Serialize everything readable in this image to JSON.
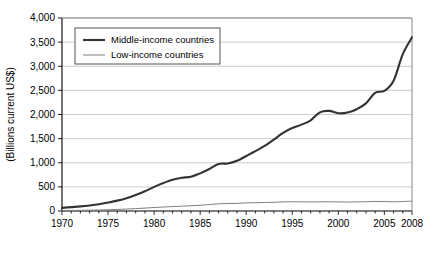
{
  "chart_data": {
    "type": "line",
    "title": "",
    "xlabel": "",
    "ylabel": "(Billions current US$)",
    "xlim": [
      1970,
      2008
    ],
    "ylim": [
      0,
      4000
    ],
    "grid": true,
    "legend_position": "top-left",
    "x_tick_labels": [
      "1970",
      "1975",
      "1980",
      "1985",
      "1990",
      "1995",
      "2000",
      "2005",
      "2008"
    ],
    "x_tick_values": [
      1970,
      1975,
      1980,
      1985,
      1990,
      1995,
      2000,
      2005,
      2008
    ],
    "x_minor_ticks": [
      1970,
      1971,
      1972,
      1973,
      1974,
      1975,
      1976,
      1977,
      1978,
      1979,
      1980,
      1981,
      1982,
      1983,
      1984,
      1985,
      1986,
      1987,
      1988,
      1989,
      1990,
      1991,
      1992,
      1993,
      1994,
      1995,
      1996,
      1997,
      1998,
      1999,
      2000,
      2001,
      2002,
      2003,
      2004,
      2005,
      2006,
      2007,
      2008
    ],
    "y_tick_labels": [
      "0",
      "500",
      "1,000",
      "1,500",
      "2,000",
      "2,500",
      "3,000",
      "3,500",
      "4,000"
    ],
    "y_tick_values": [
      0,
      500,
      1000,
      1500,
      2000,
      2500,
      3000,
      3500,
      4000
    ],
    "x": [
      1970,
      1971,
      1972,
      1973,
      1974,
      1975,
      1976,
      1977,
      1978,
      1979,
      1980,
      1981,
      1982,
      1983,
      1984,
      1985,
      1986,
      1987,
      1988,
      1989,
      1990,
      1991,
      1992,
      1993,
      1994,
      1995,
      1996,
      1997,
      1998,
      1999,
      2000,
      2001,
      2002,
      2003,
      2004,
      2005,
      2006,
      2007,
      2008
    ],
    "series": [
      {
        "name": "Middle-income countries",
        "color": "#333333",
        "width": 2.1,
        "values": [
          65,
          80,
          95,
          115,
          140,
          175,
          215,
          265,
          330,
          410,
          500,
          580,
          650,
          690,
          710,
          780,
          870,
          975,
          985,
          1040,
          1140,
          1240,
          1350,
          1480,
          1620,
          1720,
          1790,
          1880,
          2045,
          2075,
          2025,
          2040,
          2110,
          2230,
          2450,
          2490,
          2700,
          3250,
          3600
        ]
      },
      {
        "name": "Low-income countries",
        "color": "#808080",
        "width": 1.0,
        "values": [
          10,
          12,
          14,
          17,
          21,
          26,
          32,
          40,
          50,
          60,
          72,
          82,
          92,
          100,
          108,
          120,
          133,
          150,
          155,
          158,
          168,
          172,
          176,
          180,
          188,
          192,
          190,
          188,
          190,
          192,
          188,
          186,
          188,
          192,
          198,
          196,
          190,
          196,
          205
        ]
      }
    ]
  },
  "legend": {
    "items": [
      {
        "label": "Middle-income countries"
      },
      {
        "label": "Low-income countries"
      }
    ]
  }
}
